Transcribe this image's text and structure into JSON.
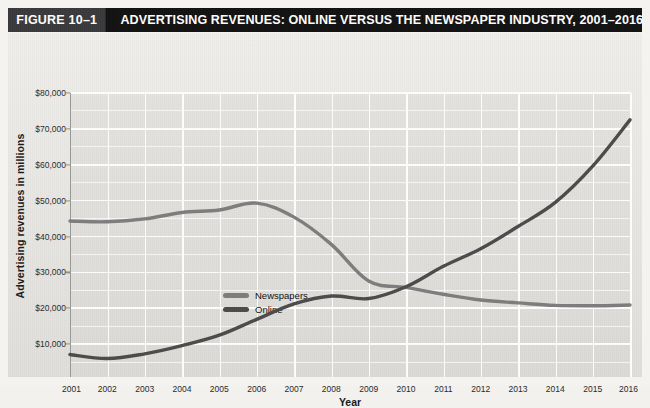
{
  "figure": {
    "number_label": "FIGURE 10–1",
    "title": "ADVERTISING REVENUES: ONLINE VERSUS THE NEWSPAPER INDUSTRY, 2001–2016"
  },
  "colors": {
    "title_bar_bg": "#111112",
    "figure_number_bg": "#3a3a3c",
    "plot_bg": "#e2e1dd",
    "gridline": "#ffffff",
    "newspapers_line": "#7d7d7d",
    "online_line": "#4b4b4b",
    "axis": "#9a9a97",
    "text": "#1a1a1a"
  },
  "chart_data": {
    "type": "line",
    "title": "ADVERTISING REVENUES: ONLINE VERSUS THE NEWSPAPER INDUSTRY, 2001–2016",
    "xlabel": "Year",
    "ylabel": "Advertising revenues in millions",
    "x": [
      2001,
      2002,
      2003,
      2004,
      2005,
      2006,
      2007,
      2008,
      2009,
      2010,
      2011,
      2012,
      2013,
      2014,
      2015,
      2016
    ],
    "categories": [
      "2001",
      "2002",
      "2003",
      "2004",
      "2005",
      "2006",
      "2007",
      "2008",
      "2009",
      "2010",
      "2011",
      "2012",
      "2013",
      "2014",
      "2015",
      "2016"
    ],
    "xlim": [
      2001,
      2016
    ],
    "ylim": [
      0,
      80000
    ],
    "y_ticks": [
      0,
      10000,
      20000,
      30000,
      40000,
      50000,
      60000,
      70000,
      80000
    ],
    "y_tick_labels": [
      "0",
      "$10,000",
      "$20,000",
      "$30,000",
      "$40,000",
      "$50,000",
      "$60,000",
      "$70,000",
      "$80,000"
    ],
    "y_minor_step": 5000,
    "grid": true,
    "legend_position": "inside-left",
    "series": [
      {
        "name": "Newspapers",
        "color": "#7d7d7d",
        "values": [
          44300,
          44100,
          44900,
          46700,
          47400,
          49300,
          45400,
          37800,
          27600,
          25800,
          23900,
          22300,
          21500,
          20800,
          20700,
          20900
        ]
      },
      {
        "name": "Online",
        "color": "#4b4b4b",
        "values": [
          7100,
          6000,
          7300,
          9600,
          12500,
          16900,
          21200,
          23400,
          22700,
          26000,
          31700,
          36600,
          42800,
          49500,
          59600,
          72500
        ]
      }
    ]
  },
  "axes": {
    "x_title": "Year",
    "y_title": "Advertising revenues in millions"
  },
  "legend": {
    "items": [
      {
        "label": "Newspapers",
        "color": "#7d7d7d"
      },
      {
        "label": "Online",
        "color": "#4b4b4b"
      }
    ]
  }
}
